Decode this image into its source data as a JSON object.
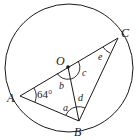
{
  "diagram": {
    "circle": {
      "cx": 69,
      "cy": 68,
      "r": 64
    },
    "points": {
      "O": {
        "label": "O",
        "x": 68,
        "y": 67
      },
      "A": {
        "label": "A",
        "x": 20,
        "y": 96
      },
      "B": {
        "label": "B",
        "x": 79,
        "y": 121
      },
      "C": {
        "label": "C",
        "x": 118,
        "y": 38
      }
    },
    "segments": [
      "A-C",
      "A-B",
      "B-C",
      "O-B"
    ],
    "angle_labels": {
      "given": "64°",
      "a": "a",
      "b": "b",
      "c": "c",
      "d": "d",
      "e": "e"
    },
    "colors": {
      "stroke": "#1a1a1a",
      "background": "#ffffff"
    }
  }
}
